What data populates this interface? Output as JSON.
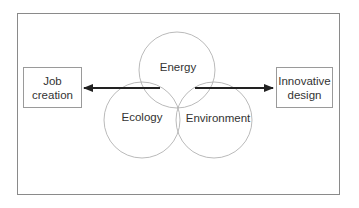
{
  "diagram": {
    "circles": [
      {
        "id": "energy",
        "label": "Energy",
        "cx": 177,
        "cy": 70,
        "r": 38,
        "label_x": 178,
        "label_y": 67
      },
      {
        "id": "ecology",
        "label": "Ecology",
        "cx": 142,
        "cy": 120,
        "r": 38,
        "label_x": 142,
        "label_y": 117
      },
      {
        "id": "environment",
        "label": "Environment",
        "cx": 214,
        "cy": 120,
        "r": 38,
        "label_x": 218,
        "label_y": 118
      }
    ],
    "boxes": {
      "left": {
        "line1": "Job",
        "line2": "creation"
      },
      "right": {
        "line1": "Innovative",
        "line2": "design"
      }
    },
    "arrows": [
      {
        "from": "center",
        "to": "Job creation",
        "direction": "left"
      },
      {
        "from": "center",
        "to": "Innovative design",
        "direction": "right"
      }
    ],
    "colors": {
      "circle_stroke": "#a8a8a8",
      "arrow": "#222222",
      "frame": "#8a8a8a",
      "text": "#333333"
    }
  }
}
